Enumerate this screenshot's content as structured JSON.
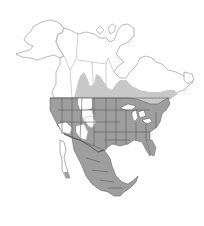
{
  "map": {
    "region": "North America",
    "type": "species-range-map",
    "legend_visible": false,
    "colors": {
      "background": "#ffffff",
      "land_outside_range": "#ffffff",
      "year_round_range": "#9e9e9e",
      "breeding_range": "#c8c8c8",
      "boundary_lines": "#555555",
      "outline_lines": "#8c8c8c"
    },
    "ranges": [
      {
        "name": "year-round",
        "shade": "dark-gray",
        "extent": "Contiguous United States (except parts of the interior West), Mexico, southern Baja"
      },
      {
        "name": "breeding",
        "shade": "light-gray",
        "extent": "Southern Canada band from the Prairie provinces east to the Maritimes"
      }
    ]
  }
}
